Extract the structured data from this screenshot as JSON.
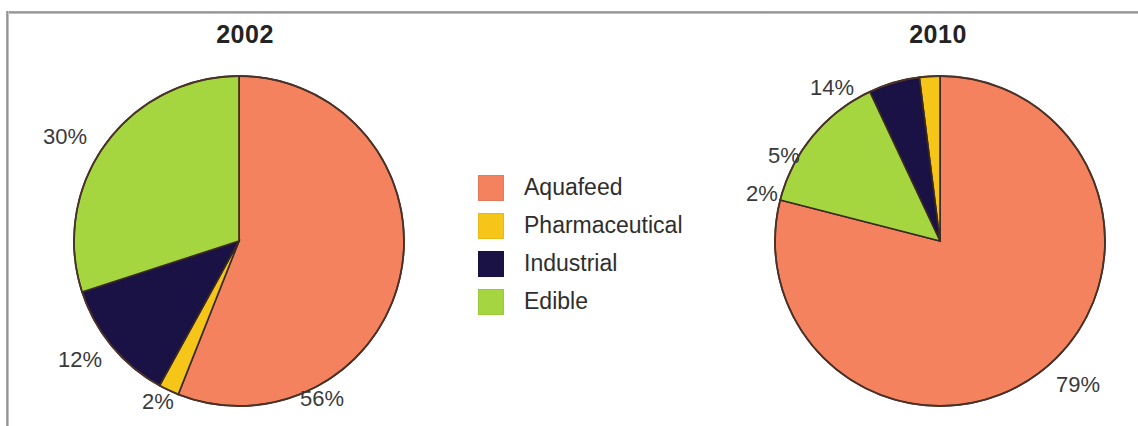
{
  "frame": {
    "border_color": "#8c8c8c",
    "background": "#ffffff"
  },
  "legend": {
    "items": [
      {
        "label": "Aquafeed",
        "color": "#F4825E"
      },
      {
        "label": "Pharmaceutical",
        "color": "#F5C518"
      },
      {
        "label": "Industrial",
        "color": "#1A1145"
      },
      {
        "label": "Edible",
        "color": "#A5D63F"
      }
    ]
  },
  "charts": [
    {
      "title": "2002",
      "labels": {
        "aquafeed": "56%",
        "pharmaceutical": "2%",
        "industrial": "12%",
        "edible": "30%"
      }
    },
    {
      "title": "2010",
      "labels": {
        "aquafeed": "79%",
        "edible": "14%",
        "industrial": "5%",
        "pharmaceutical": "2%"
      }
    }
  ],
  "chart_data": [
    {
      "type": "pie",
      "title": "2002",
      "categories": [
        "Aquafeed",
        "Pharmaceutical",
        "Industrial",
        "Edible"
      ],
      "values": [
        56,
        2,
        12,
        30
      ],
      "value_labels": [
        "56%",
        "2%",
        "12%",
        "30%"
      ],
      "colors": [
        "#F4825E",
        "#F5C518",
        "#1A1145",
        "#A5D63F"
      ],
      "units": "percent",
      "start_angle_deg": 0,
      "direction": "clockwise",
      "legend_position": "center",
      "grid": false,
      "xlabel": "",
      "ylabel": ""
    },
    {
      "type": "pie",
      "title": "2010",
      "categories": [
        "Aquafeed",
        "Edible",
        "Industrial",
        "Pharmaceutical"
      ],
      "values": [
        79,
        14,
        5,
        2
      ],
      "value_labels": [
        "79%",
        "14%",
        "5%",
        "2%"
      ],
      "colors": [
        "#F4825E",
        "#A5D63F",
        "#1A1145",
        "#F5C518"
      ],
      "units": "percent",
      "start_angle_deg": 0,
      "direction": "clockwise",
      "legend_position": "center",
      "grid": false,
      "xlabel": "",
      "ylabel": ""
    }
  ]
}
